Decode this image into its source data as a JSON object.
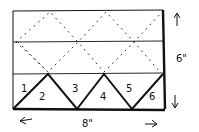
{
  "diagram": {
    "triangle_labels": [
      "1",
      "2",
      "3",
      "4",
      "5",
      "6"
    ],
    "dimensions": {
      "width_label": "8\"",
      "height_label": "6\""
    },
    "colors": {
      "ink": "#111111",
      "background": "#ffffff"
    }
  }
}
